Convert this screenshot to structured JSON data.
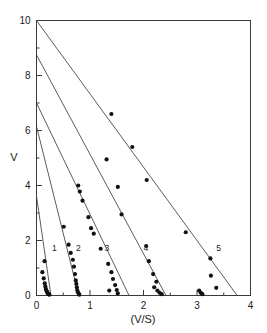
{
  "chart_data": {
    "type": "scatter",
    "title": "",
    "subtitle": "",
    "xlabel": "(V/S)",
    "ylabel": "V",
    "xlim": [
      0,
      4
    ],
    "ylim": [
      0,
      10
    ],
    "grid": false,
    "legend_position": "inline-curve-labels",
    "x_ticks_major": [
      0,
      1,
      2,
      3,
      4
    ],
    "x_ticks_major_labels": [
      "0",
      "1",
      "2",
      "3",
      "4"
    ],
    "x_ticks_minor": [
      0.5,
      1.5,
      2.5,
      3.5
    ],
    "y_ticks_major": [
      0,
      2,
      4,
      6,
      8,
      10
    ],
    "y_ticks_major_labels": [
      "0",
      "2",
      "4",
      "6",
      "8",
      "10"
    ],
    "y_ticks_minor": [
      1,
      3,
      5,
      7,
      9
    ],
    "series": [
      {
        "name": "1",
        "label": "1",
        "label_x": 0.29,
        "label_y": 1.62,
        "line": {
          "x_intercept": 0.27,
          "y_intercept": 3.62,
          "slope": -13.41
        },
        "points": [
          [
            0.15,
            1.25
          ],
          [
            0.11,
            0.85
          ],
          [
            0.135,
            0.62
          ],
          [
            0.155,
            0.44
          ],
          [
            0.165,
            0.33
          ],
          [
            0.175,
            0.24
          ],
          [
            0.185,
            0.17
          ],
          [
            0.2,
            0.13
          ],
          [
            0.21,
            0.08
          ],
          [
            0.225,
            0.05
          ],
          [
            0.24,
            0.03
          ]
        ]
      },
      {
        "name": "2",
        "label": "2",
        "label_x": 0.74,
        "label_y": 1.62,
        "line": {
          "x_intercept": 0.79,
          "y_intercept": 6.15,
          "slope": -7.78
        },
        "points": [
          [
            0.51,
            2.5
          ],
          [
            0.6,
            1.85
          ],
          [
            0.64,
            1.55
          ],
          [
            0.68,
            1.3
          ],
          [
            0.7,
            1.05
          ],
          [
            0.72,
            0.78
          ],
          [
            0.735,
            0.55
          ],
          [
            0.745,
            0.42
          ],
          [
            0.755,
            0.3
          ],
          [
            0.76,
            0.2
          ],
          [
            0.775,
            0.12
          ],
          [
            0.79,
            0.06
          ],
          [
            0.8,
            0.03
          ]
        ]
      },
      {
        "name": "3",
        "label": "3",
        "label_x": 1.27,
        "label_y": 1.62,
        "line": {
          "x_intercept": 1.73,
          "y_intercept": 7.0,
          "slope": -4.05
        },
        "points": [
          [
            0.78,
            4.0
          ],
          [
            0.81,
            3.78
          ],
          [
            0.86,
            3.45
          ],
          [
            0.97,
            2.85
          ],
          [
            1.02,
            2.45
          ],
          [
            1.07,
            2.25
          ],
          [
            1.2,
            1.7
          ],
          [
            1.34,
            1.15
          ],
          [
            1.4,
            0.85
          ],
          [
            1.43,
            0.6
          ],
          [
            1.47,
            0.38
          ],
          [
            1.36,
            0.18
          ],
          [
            1.5,
            0.2
          ],
          [
            1.52,
            0.08
          ]
        ]
      },
      {
        "name": "4",
        "label": "4",
        "label_x": 2.0,
        "label_y": 1.62,
        "line": {
          "x_intercept": 2.42,
          "y_intercept": 8.75,
          "slope": -3.62
        },
        "points": [
          [
            1.31,
            4.95
          ],
          [
            1.52,
            3.95
          ],
          [
            1.59,
            2.95
          ],
          [
            2.05,
            1.8
          ],
          [
            2.1,
            1.25
          ],
          [
            2.18,
            0.78
          ],
          [
            2.24,
            0.5
          ],
          [
            2.2,
            0.3
          ],
          [
            2.26,
            0.18
          ],
          [
            2.3,
            0.1
          ],
          [
            2.34,
            0.05
          ]
        ]
      },
      {
        "name": "5",
        "label": "5",
        "label_x": 3.36,
        "label_y": 1.62,
        "line": {
          "x_intercept": 3.75,
          "y_intercept": 10.0,
          "slope": -2.67
        },
        "points": [
          [
            1.4,
            6.6
          ],
          [
            1.79,
            5.4
          ],
          [
            2.06,
            4.2
          ],
          [
            2.79,
            2.3
          ],
          [
            3.25,
            1.35
          ],
          [
            3.26,
            0.72
          ],
          [
            3.36,
            0.28
          ],
          [
            3.04,
            0.18
          ],
          [
            3.07,
            0.1
          ],
          [
            3.1,
            0.05
          ]
        ]
      }
    ]
  }
}
